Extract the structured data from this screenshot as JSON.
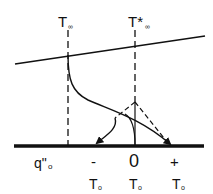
{
  "labels": {
    "t_inf": "T",
    "t_inf_sub": "∞",
    "t_inf_star": "T*",
    "t_inf_star_sub": "∞",
    "q_flux": "q\"",
    "q_flux_sub": "o",
    "sign_minus": "-",
    "sign_zero": "0",
    "sign_plus": "+",
    "t_o": "T",
    "t_o_sub": "o"
  },
  "colors": {
    "stroke": "#111111",
    "background": "#ffffff"
  }
}
